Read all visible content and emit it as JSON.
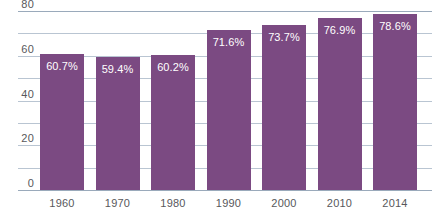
{
  "chart_data": {
    "type": "bar",
    "title": "",
    "subtitle": "",
    "xlabel": "",
    "ylabel": "",
    "categories": [
      "1960",
      "1970",
      "1980",
      "1990",
      "2000",
      "2010",
      "2014"
    ],
    "values": [
      60.7,
      59.4,
      60.2,
      71.6,
      73.7,
      76.9,
      78.6
    ],
    "data_labels": [
      "60.7%",
      "59.4%",
      "60.2%",
      "71.6%",
      "73.7%",
      "76.9%",
      "78.6%"
    ],
    "ylim": [
      0,
      80
    ],
    "y_tick_labels": [
      "80",
      "60",
      "40",
      "20",
      "0"
    ],
    "y_tick_values": [
      80,
      60,
      40,
      20,
      0
    ],
    "gridline_values": [
      80,
      70,
      60,
      50,
      40,
      30,
      20,
      10,
      0
    ],
    "grid": true,
    "legend": false,
    "legend_position": "none",
    "bar_color": "#7b4a82",
    "grid_color": "#b9c5d2",
    "axis_color": "#9aaabb",
    "tick_label_color": "#58585b",
    "data_label_color": "#ffffff",
    "background_color": "#ffffff"
  }
}
